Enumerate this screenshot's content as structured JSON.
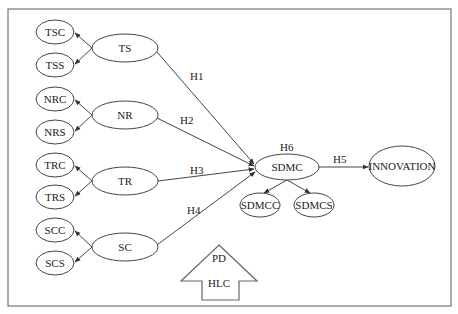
{
  "diagram": {
    "type": "structural-model",
    "constructs": [
      {
        "id": "TS",
        "label": "TS",
        "dimensions": [
          {
            "id": "TSC",
            "label": "TSC"
          },
          {
            "id": "TSS",
            "label": "TSS"
          }
        ]
      },
      {
        "id": "NR",
        "label": "NR",
        "dimensions": [
          {
            "id": "NRC",
            "label": "NRC"
          },
          {
            "id": "NRS",
            "label": "NRS"
          }
        ]
      },
      {
        "id": "TR",
        "label": "TR",
        "dimensions": [
          {
            "id": "TRC",
            "label": "TRC"
          },
          {
            "id": "TRS",
            "label": "TRS"
          }
        ]
      },
      {
        "id": "SC",
        "label": "SC",
        "dimensions": [
          {
            "id": "SCC",
            "label": "SCC"
          },
          {
            "id": "SCS",
            "label": "SCS"
          }
        ]
      }
    ],
    "mediator": {
      "id": "SDMC",
      "label": "SDMC",
      "hypothesis": "H6",
      "dimensions": [
        {
          "id": "SDMCC",
          "label": "SDMCC"
        },
        {
          "id": "SDMCS",
          "label": "SDMCS"
        }
      ]
    },
    "outcome": {
      "id": "INNOVATION",
      "label": "INNOVATION"
    },
    "paths": [
      {
        "from": "TS",
        "to": "SDMC",
        "label": "H1"
      },
      {
        "from": "NR",
        "to": "SDMC",
        "label": "H2"
      },
      {
        "from": "TR",
        "to": "SDMC",
        "label": "H3"
      },
      {
        "from": "SC",
        "to": "SDMC",
        "label": "H4"
      },
      {
        "from": "SDMC",
        "to": "INNOVATION",
        "label": "H5"
      }
    ],
    "controls_arrow": {
      "lines": [
        "PD",
        "HLC"
      ]
    },
    "colors": {
      "stroke": "#444444",
      "frame": "#777777",
      "background": "#ffffff"
    }
  }
}
